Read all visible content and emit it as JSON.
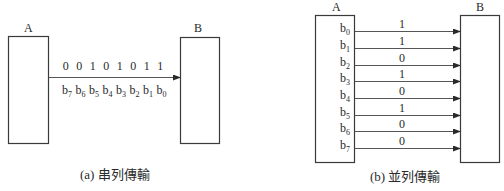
{
  "serial": {
    "sender_label": "A",
    "receiver_label": "B",
    "bit_values": [
      "0",
      "0",
      "1",
      "0",
      "1",
      "0",
      "1",
      "1"
    ],
    "bit_names": [
      {
        "base": "b",
        "sub": "7"
      },
      {
        "base": "b",
        "sub": "6"
      },
      {
        "base": "b",
        "sub": "5"
      },
      {
        "base": "b",
        "sub": "4"
      },
      {
        "base": "b",
        "sub": "3"
      },
      {
        "base": "b",
        "sub": "2"
      },
      {
        "base": "b",
        "sub": "1"
      },
      {
        "base": "b",
        "sub": "0"
      }
    ],
    "caption": "(a) 串列傳輸"
  },
  "parallel": {
    "sender_label": "A",
    "receiver_label": "B",
    "lines": [
      {
        "base": "b",
        "sub": "0",
        "value": "1"
      },
      {
        "base": "b",
        "sub": "1",
        "value": "1"
      },
      {
        "base": "b",
        "sub": "2",
        "value": "0"
      },
      {
        "base": "b",
        "sub": "3",
        "value": "1"
      },
      {
        "base": "b",
        "sub": "4",
        "value": "0"
      },
      {
        "base": "b",
        "sub": "5",
        "value": "1"
      },
      {
        "base": "b",
        "sub": "6",
        "value": "0"
      },
      {
        "base": "b",
        "sub": "7",
        "value": "0"
      }
    ],
    "caption": "(b) 並列傳輸"
  },
  "colors": {
    "stroke": "#3a3a3a",
    "text": "#2a2a2a",
    "background": "#ffffff"
  }
}
